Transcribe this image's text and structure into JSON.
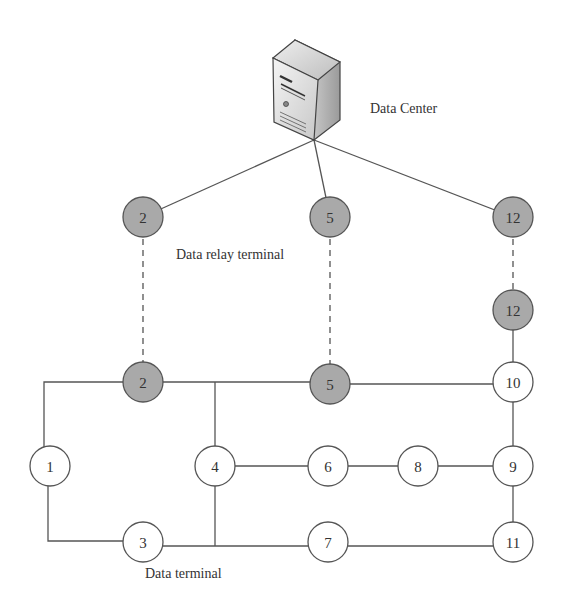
{
  "labels": {
    "data_center": "Data Center",
    "data_relay_terminal": "Data relay terminal",
    "data_terminal": "Data terminal"
  },
  "colors": {
    "relay_fill": "#a9a9a9",
    "terminal_fill": "#ffffff",
    "stroke": "#555555"
  },
  "server": {
    "icon": "server-tower-icon",
    "anchor": [
      314,
      140
    ]
  },
  "nodes": [
    {
      "id": "r2-top",
      "label": "2",
      "type": "relay",
      "x": 143,
      "y": 217
    },
    {
      "id": "r5-top",
      "label": "5",
      "type": "relay",
      "x": 330,
      "y": 217
    },
    {
      "id": "r12-top",
      "label": "12",
      "type": "relay",
      "x": 513,
      "y": 217
    },
    {
      "id": "r12-mid",
      "label": "12",
      "type": "relay",
      "x": 513,
      "y": 310
    },
    {
      "id": "n2",
      "label": "2",
      "type": "relay",
      "x": 143,
      "y": 382
    },
    {
      "id": "n5",
      "label": "5",
      "type": "relay",
      "x": 330,
      "y": 384
    },
    {
      "id": "n10",
      "label": "10",
      "type": "terminal",
      "x": 513,
      "y": 382
    },
    {
      "id": "n1",
      "label": "1",
      "type": "terminal",
      "x": 50,
      "y": 466
    },
    {
      "id": "n4",
      "label": "4",
      "type": "terminal",
      "x": 215,
      "y": 466
    },
    {
      "id": "n6",
      "label": "6",
      "type": "terminal",
      "x": 328,
      "y": 466
    },
    {
      "id": "n8",
      "label": "8",
      "type": "terminal",
      "x": 418,
      "y": 466
    },
    {
      "id": "n9",
      "label": "9",
      "type": "terminal",
      "x": 513,
      "y": 466
    },
    {
      "id": "n3",
      "label": "3",
      "type": "terminal",
      "x": 143,
      "y": 542
    },
    {
      "id": "n7",
      "label": "7",
      "type": "terminal",
      "x": 328,
      "y": 542
    },
    {
      "id": "n11",
      "label": "11",
      "type": "terminal",
      "x": 513,
      "y": 542
    }
  ],
  "edges": [
    {
      "points": [
        [
          314,
          140
        ],
        [
          143,
          217
        ]
      ],
      "style": "solid"
    },
    {
      "points": [
        [
          314,
          140
        ],
        [
          330,
          217
        ]
      ],
      "style": "solid"
    },
    {
      "points": [
        [
          314,
          140
        ],
        [
          513,
          217
        ]
      ],
      "style": "solid"
    },
    {
      "points": [
        [
          143,
          217
        ],
        [
          143,
          382
        ]
      ],
      "style": "dashed"
    },
    {
      "points": [
        [
          330,
          217
        ],
        [
          330,
          384
        ]
      ],
      "style": "dashed"
    },
    {
      "points": [
        [
          513,
          217
        ],
        [
          513,
          310
        ]
      ],
      "style": "dashed"
    },
    {
      "points": [
        [
          513,
          310
        ],
        [
          513,
          382
        ]
      ],
      "style": "solid"
    },
    {
      "points": [
        [
          143,
          382
        ],
        [
          44,
          382
        ],
        [
          44,
          466
        ]
      ],
      "style": "solid"
    },
    {
      "points": [
        [
          143,
          382
        ],
        [
          330,
          382
        ]
      ],
      "style": "solid"
    },
    {
      "points": [
        [
          215,
          382
        ],
        [
          215,
          466
        ]
      ],
      "style": "solid"
    },
    {
      "points": [
        [
          330,
          384
        ],
        [
          513,
          384
        ]
      ],
      "style": "solid"
    },
    {
      "points": [
        [
          513,
          382
        ],
        [
          513,
          466
        ]
      ],
      "style": "solid"
    },
    {
      "points": [
        [
          215,
          466
        ],
        [
          513,
          466
        ]
      ],
      "style": "solid"
    },
    {
      "points": [
        [
          513,
          466
        ],
        [
          513,
          542
        ]
      ],
      "style": "solid"
    },
    {
      "points": [
        [
          48,
          466
        ],
        [
          48,
          541
        ],
        [
          143,
          541
        ]
      ],
      "style": "solid"
    },
    {
      "points": [
        [
          143,
          546
        ],
        [
          513,
          546
        ]
      ],
      "style": "solid"
    },
    {
      "points": [
        [
          215,
          466
        ],
        [
          215,
          546
        ]
      ],
      "style": "solid"
    }
  ]
}
